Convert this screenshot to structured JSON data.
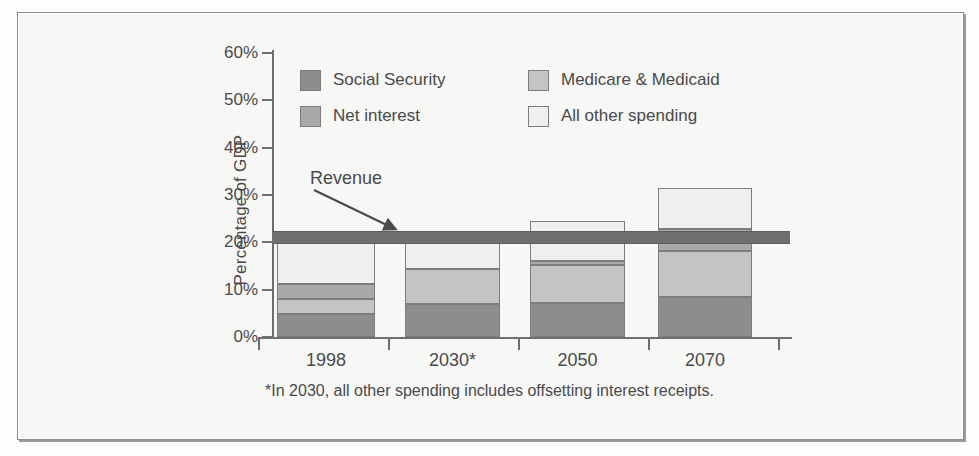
{
  "figure": {
    "y_axis_title": "Percentage of GDP",
    "footnote": "*In 2030, all other spending includes offsetting interest receipts.",
    "revenue_annotation": "Revenue"
  },
  "legend": [
    {
      "label": "Social Security",
      "color": "#8d8d8d",
      "key": "social_security"
    },
    {
      "label": "Medicare & Medicaid",
      "color": "#c4c4c4",
      "key": "medicare_medicaid"
    },
    {
      "label": "Net interest",
      "color": "#a9a9a9",
      "key": "net_interest"
    },
    {
      "label": "All other spending",
      "color": "#efefee",
      "key": "all_other_spending"
    }
  ],
  "chart_data": {
    "type": "bar",
    "title": "",
    "xlabel": "",
    "ylabel": "Percentage of GDP",
    "ylim": [
      0,
      60
    ],
    "ytick_labels": [
      "60%",
      "50%",
      "40%",
      "30%",
      "20%",
      "10%",
      "0%"
    ],
    "ytick_values": [
      60,
      50,
      40,
      30,
      20,
      10,
      0
    ],
    "grid": false,
    "stacked": true,
    "legend_position": "upper-center-inside",
    "categories": [
      "1998",
      "2030*",
      "2050",
      "2070"
    ],
    "series": [
      {
        "name": "Social Security",
        "color": "#8d8d8d",
        "values": [
          4.8,
          7.0,
          7.2,
          8.5
        ]
      },
      {
        "name": "Medicare & Medicaid",
        "color": "#c4c4c4",
        "values": [
          3.2,
          7.4,
          8.0,
          9.7
        ]
      },
      {
        "name": "Net interest",
        "color": "#a9a9a9",
        "values": [
          3.2,
          0.0,
          0.9,
          4.7
        ]
      },
      {
        "name": "All other spending",
        "color": "#efefee",
        "values": [
          8.8,
          5.6,
          8.4,
          8.6
        ]
      }
    ],
    "totals": [
      20.0,
      20.0,
      24.5,
      31.5
    ],
    "reference_line": {
      "name": "Revenue",
      "value": 21.0,
      "color": "#6f6f6f"
    }
  }
}
